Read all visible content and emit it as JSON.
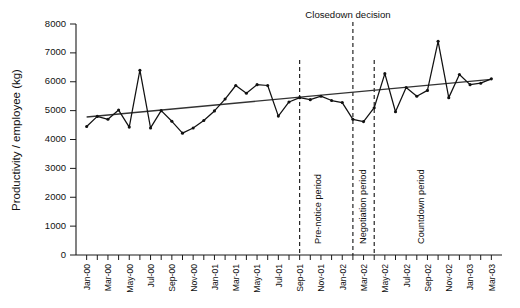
{
  "chart_data": {
    "type": "line",
    "title": "",
    "xlabel": "",
    "ylabel": "Productivity / employee (kg)",
    "ylim": [
      0,
      8000
    ],
    "ytick_values": [
      0,
      1000,
      2000,
      3000,
      4000,
      5000,
      6000,
      7000,
      8000
    ],
    "ytick_labels": [
      "0",
      "1000",
      "2000",
      "3000",
      "4000",
      "5000",
      "6000",
      "7000",
      "8000"
    ],
    "grid": false,
    "legend": "none",
    "x": [
      "Jan-00",
      "Feb-00",
      "Mar-00",
      "Apr-00",
      "May-00",
      "Jun-00",
      "Jul-00",
      "Aug-00",
      "Sep-00",
      "Oct-00",
      "Nov-00",
      "Dec-00",
      "Jan-01",
      "Feb-01",
      "Mar-01",
      "Apr-01",
      "May-01",
      "Jun-01",
      "Jul-01",
      "Aug-01",
      "Sep-01",
      "Oct-01",
      "Nov-01",
      "Dec-01",
      "Jan-02",
      "Feb-02",
      "Mar-02",
      "Apr-02",
      "May-02",
      "Jun-02",
      "Jul-02",
      "Aug-02",
      "Sep-02",
      "Oct-02",
      "Nov-02",
      "Dec-02",
      "Jan-03",
      "Feb-03",
      "Mar-03"
    ],
    "xtick_labels": [
      "Jan-00",
      "Mar-00",
      "May-00",
      "Jul-00",
      "Sep-00",
      "Nov-00",
      "Jan-01",
      "Mar-01",
      "May-01",
      "Jul-01",
      "Sep-01",
      "Nov-01",
      "Jan-02",
      "Mar-02",
      "May-02",
      "Jul-02",
      "Sep-02",
      "Nov-02",
      "Jan-03",
      "Mar-03"
    ],
    "xtick_interval_months": 2,
    "series": [
      {
        "name": "Productivity / employee (kg)",
        "values": [
          4450,
          4800,
          4700,
          5020,
          4430,
          6400,
          4400,
          5000,
          4630,
          4220,
          4400,
          4660,
          4990,
          5400,
          5870,
          5600,
          5900,
          5870,
          4810,
          5300,
          5450,
          5380,
          5500,
          5350,
          5280,
          4700,
          4620,
          5100,
          6280,
          4960,
          5800,
          5500,
          5700,
          7400,
          5450,
          6250,
          5900,
          5950,
          6100
        ]
      }
    ],
    "trendline": {
      "name": "linear trend",
      "start_value": 4780,
      "end_value": 6080
    },
    "events": [
      {
        "id": "pre-notice-start",
        "x_label": "Sep-01",
        "x_index": 20,
        "label": "Pre-notice period"
      },
      {
        "id": "closedown-decision",
        "x_label": "Feb-02",
        "x_index": 25,
        "label": "Negotiation period",
        "top_label": "Closedown decision"
      },
      {
        "id": "countdown-start",
        "x_label": "Apr-02",
        "x_index": 27,
        "label": "Countdown period"
      }
    ],
    "annotations": [
      {
        "id": "closedown-decision-title",
        "text": "Closedown decision"
      },
      {
        "id": "pre-notice-period",
        "text": "Pre-notice period"
      },
      {
        "id": "negotiation-period",
        "text": "Negotiation period"
      },
      {
        "id": "countdown-period",
        "text": "Countdown period"
      }
    ],
    "colors": {
      "series": "#111111",
      "trend": "#333333",
      "axis": "#1a1a1a",
      "event": "#111111",
      "background": "#ffffff"
    }
  }
}
